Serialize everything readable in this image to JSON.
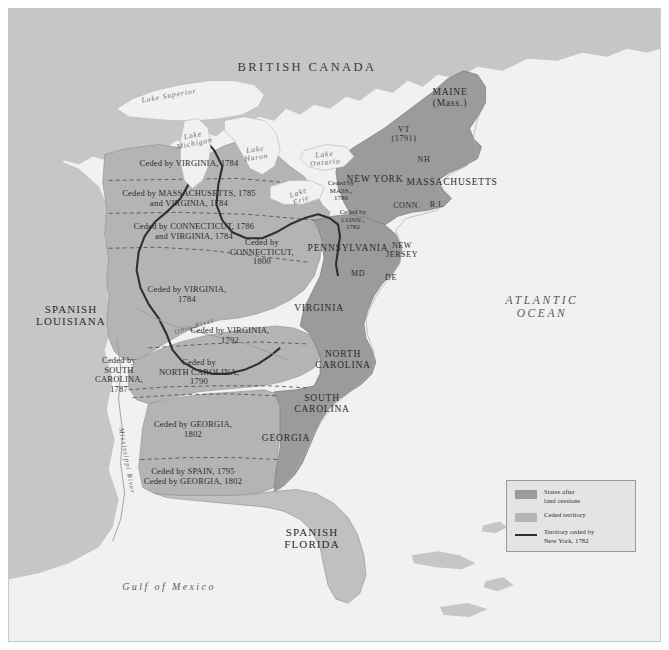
{
  "map": {
    "title": "Western Land Cessions, 1782-1802",
    "colors": {
      "ocean": "#f1f1f1",
      "land_foreign": "#c6c6c6",
      "ceded_territory": "#b4b4b4",
      "states": "#9b9b9b",
      "ny_cession_line": "#2f2f2f",
      "border": "#7b7b7b",
      "frame": "#c9c9c9",
      "label_text": "#2b2b2b"
    },
    "regions": [
      {
        "name": "british-canada",
        "label": "BRITISH CANADA",
        "x": 298,
        "y": 58
      },
      {
        "name": "spanish-louisiana",
        "label": "SPANISH\nLOUISIANA",
        "x": 62,
        "y": 306
      },
      {
        "name": "spanish-florida",
        "label": "SPANISH\nFLORIDA",
        "x": 303,
        "y": 529
      },
      {
        "name": "atlantic-ocean",
        "label": "ATLANTIC\nOCEAN",
        "x": 533,
        "y": 298
      },
      {
        "name": "gulf-of-mexico",
        "label": "Gulf of Mexico",
        "x": 160,
        "y": 578
      }
    ],
    "lakes": [
      {
        "name": "lake-superior",
        "label": "Lake Superior",
        "x": 160,
        "y": 87,
        "rot": -10
      },
      {
        "name": "lake-michigan",
        "label": "Lake\nMichigan",
        "x": 185,
        "y": 131,
        "rot": -12
      },
      {
        "name": "lake-huron",
        "label": "Lake\nHuron",
        "x": 247,
        "y": 145,
        "rot": -8
      },
      {
        "name": "lake-ontario",
        "label": "Lake\nOntario",
        "x": 316,
        "y": 150,
        "rot": -6
      },
      {
        "name": "lake-erie",
        "label": "Lake\nErie",
        "x": 291,
        "y": 188,
        "rot": -20
      }
    ],
    "rivers": [
      {
        "name": "ohio-river",
        "label": "Ohio River",
        "x": 186,
        "y": 318,
        "rot": -17
      },
      {
        "name": "mississippi-river",
        "label": "Mississippi River",
        "x": 117,
        "y": 452,
        "rot": 80
      }
    ],
    "states": [
      {
        "name": "maine",
        "label": "MAINE\n(Mass.)",
        "x": 441,
        "y": 89,
        "size": "t-state"
      },
      {
        "name": "vermont",
        "label": "VT\n(1791)",
        "x": 395,
        "y": 126,
        "size": "t-state-sm"
      },
      {
        "name": "new-hampshire",
        "label": "NH",
        "x": 415,
        "y": 151,
        "size": "t-state-sm"
      },
      {
        "name": "new-york",
        "label": "NEW YORK",
        "x": 366,
        "y": 170,
        "size": "t-state"
      },
      {
        "name": "massachusetts",
        "label": "MASSACHUSETTS",
        "x": 443,
        "y": 173,
        "size": "t-state"
      },
      {
        "name": "connecticut",
        "label": "CONN.",
        "x": 398,
        "y": 197,
        "size": "t-state-sm"
      },
      {
        "name": "rhode-island",
        "label": "R.I.",
        "x": 428,
        "y": 196,
        "size": "t-state-sm"
      },
      {
        "name": "pennsylvania",
        "label": "PENNSYLVANIA",
        "x": 339,
        "y": 239,
        "size": "t-state"
      },
      {
        "name": "new-jersey",
        "label": "NEW\nJERSEY",
        "x": 393,
        "y": 242,
        "size": "t-state-sm"
      },
      {
        "name": "maryland",
        "label": "MD",
        "x": 349,
        "y": 265,
        "size": "t-state-sm"
      },
      {
        "name": "delaware",
        "label": "DE",
        "x": 382,
        "y": 269,
        "size": "t-state-sm"
      },
      {
        "name": "virginia",
        "label": "VIRGINIA",
        "x": 310,
        "y": 299,
        "size": "t-state"
      },
      {
        "name": "north-carolina",
        "label": "NORTH\nCAROLINA",
        "x": 334,
        "y": 351,
        "size": "t-state"
      },
      {
        "name": "south-carolina",
        "label": "SOUTH\nCAROLINA",
        "x": 313,
        "y": 395,
        "size": "t-state"
      },
      {
        "name": "georgia",
        "label": "GEORGIA",
        "x": 277,
        "y": 429,
        "size": "t-state"
      }
    ],
    "cessions": [
      {
        "name": "cession-virginia-1784-north",
        "label": "Ceded by VIRGINIA, 1784",
        "x": 180,
        "y": 155,
        "size": "t-ceded"
      },
      {
        "name": "cession-massachusetts-1785",
        "label": "Ceded by MASSACHUSETTS, 1785\nand VIRGINIA, 1784",
        "x": 180,
        "y": 190,
        "size": "t-ceded"
      },
      {
        "name": "cession-connecticut-1786",
        "label": "Ceded by CONNECTICUT, 1786\nand VIRGINIA, 1784",
        "x": 185,
        "y": 223,
        "size": "t-ceded"
      },
      {
        "name": "cession-connecticut-1800",
        "label": "Ceded by\nCONNECTICUT,\n1800",
        "x": 253,
        "y": 243,
        "size": "t-ceded"
      },
      {
        "name": "cession-virginia-1784-south",
        "label": "Ceded by VIRGINIA,\n1784",
        "x": 178,
        "y": 286,
        "size": "t-ceded"
      },
      {
        "name": "cession-virginia-1792",
        "label": "Ceded by VIRGINIA,\n1792",
        "x": 221,
        "y": 327,
        "size": "t-ceded"
      },
      {
        "name": "cession-north-carolina-1790",
        "label": "Ceded by\nNORTH CAROLINA,\n1790",
        "x": 190,
        "y": 363,
        "size": "t-ceded"
      },
      {
        "name": "cession-south-carolina-1787",
        "label": "Ceded by\nSOUTH\nCAROLINA,\n1787",
        "x": 110,
        "y": 366,
        "size": "t-ceded"
      },
      {
        "name": "cession-georgia-1802",
        "label": "Ceded by GEORGIA,\n1802",
        "x": 184,
        "y": 421,
        "size": "t-ceded"
      },
      {
        "name": "cession-spain-1795",
        "label": "Ceded by SPAIN, 1795\nCeded by GEORGIA, 1802",
        "x": 184,
        "y": 468,
        "size": "t-ceded"
      },
      {
        "name": "cession-massachusetts-1786-ny",
        "label": "Ceded by\nMASS.,\n1786",
        "x": 332,
        "y": 181,
        "size": "t-ceded-sm"
      },
      {
        "name": "cession-connecticut-1782-pa",
        "label": "Ceded by\nCONN.,\n1782",
        "x": 344,
        "y": 210,
        "size": "t-ceded-sm"
      }
    ],
    "legend": {
      "name": "map-legend",
      "items": [
        {
          "key": "states",
          "label": "States after\nland cessions"
        },
        {
          "key": "ceded",
          "label": "Ceded territory"
        },
        {
          "key": "line",
          "label": "Territory ceded by\nNew York, 1782"
        }
      ]
    }
  }
}
